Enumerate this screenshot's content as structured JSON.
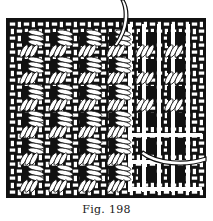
{
  "figure": {
    "caption": "Fig. 198",
    "colors": {
      "ink": "#111111",
      "paper": "#ffffff"
    }
  }
}
